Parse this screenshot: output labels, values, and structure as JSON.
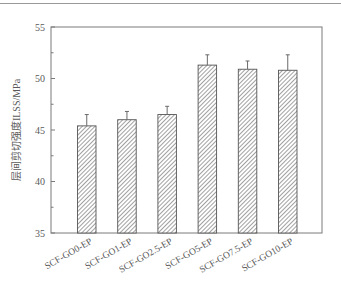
{
  "chart_data": {
    "type": "bar",
    "title": "",
    "xlabel": "",
    "ylabel": "层间剪切强度ILSS/MPa",
    "ylim": [
      35,
      55
    ],
    "yticks": [
      35,
      40,
      45,
      50,
      55
    ],
    "minor_ytick_step": 2.5,
    "grid": false,
    "legend": null,
    "categories": [
      "SCF-GO0-EP",
      "SCF-GO1-EP",
      "SCF-GO2.5-EP",
      "SCF-GO5-EP",
      "SCF-GO7.5-EP",
      "SCF-GO10-EP"
    ],
    "values": [
      45.4,
      46.0,
      46.5,
      51.3,
      50.9,
      50.8
    ],
    "error_upper": [
      1.1,
      0.8,
      0.8,
      1.0,
      0.8,
      1.5
    ],
    "bar_style": "hatched diagonal (\\\\), gray on white, dark outline",
    "x_tick_label_rotation": -30
  },
  "colors": {
    "axis": "#7a7a7a",
    "bar_outline": "#555555",
    "hatch": "#6e6e6e",
    "bar_fill": "#ffffff",
    "error_bar": "#6a6a6a",
    "text": "#5a5a5a",
    "top_rule": "#9a9a9a"
  }
}
